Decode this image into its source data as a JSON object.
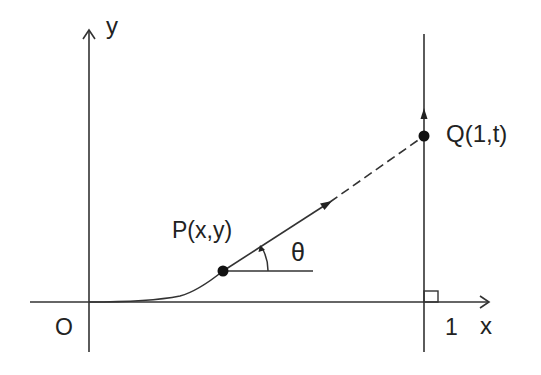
{
  "diagram": {
    "labels": {
      "y_axis": "y",
      "x_axis": "x",
      "origin": "O",
      "x_tick": "1",
      "point_p": "P(x,y)",
      "point_q": "Q(1,t)",
      "angle": "θ"
    },
    "colors": {
      "stroke": "#333333",
      "text": "#222222",
      "point": "#111111",
      "background": "#ffffff"
    },
    "elements": {
      "axes": [
        "x-axis",
        "y-axis"
      ],
      "vertical_line": "x = 1",
      "curve": "path of P from origin",
      "tangent": "solid segment P toward Q with arrow, dashed continuation to Q",
      "angle_marker": "arc from horizontal to tangent with arrow",
      "right_angle_marker": "at (1,0)"
    }
  }
}
